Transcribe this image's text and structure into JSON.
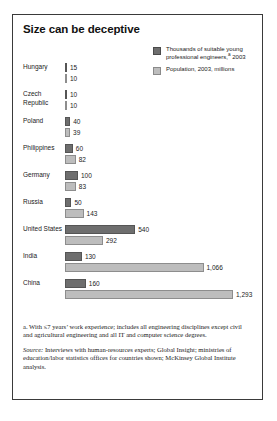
{
  "exhibit": {
    "title": "Size can be deceptive"
  },
  "legend": {
    "items": [
      {
        "label": "Thousands of suitable young professional engineers,",
        "sup": "a",
        "label_tail": " 2003",
        "swatch": "dark",
        "color": "#6e6e6e"
      },
      {
        "label": "Population, 2003, millions",
        "sup": "",
        "label_tail": "",
        "swatch": "light",
        "color": "#bdbdbd"
      }
    ]
  },
  "notes": {
    "footnote_marker": "a.",
    "footnote": "With ≤7 years’ work experience; includes all engineering disciplines except civil and agricultural engineering and all IT and computer science degrees.",
    "source_label": "Source:",
    "source": "Interviews with human-resources experts; Global Insight; ministries of education/labor statistics offices for countries shown; McKinsey Global Institute analysis."
  },
  "chart_data": {
    "type": "bar",
    "title": "Size can be deceptive",
    "xlabel": "",
    "ylabel": "",
    "orientation": "horizontal",
    "grid": false,
    "legend_position": "top-right",
    "xlim": [
      0,
      1293
    ],
    "categories": [
      "Hungary",
      "Czech Republic",
      "Poland",
      "Philippines",
      "Germany",
      "Russia",
      "United States",
      "India",
      "China"
    ],
    "series": [
      {
        "name": "Thousands of suitable young professional engineers,a 2003",
        "color": "#6e6e6e",
        "values": [
          15,
          10,
          40,
          60,
          100,
          50,
          540,
          130,
          160
        ],
        "labels": [
          "15",
          "10",
          "40",
          "60",
          "100",
          "50",
          "540",
          "130",
          "160"
        ]
      },
      {
        "name": "Population, 2003, millions",
        "color": "#bdbdbd",
        "values": [
          10,
          10,
          39,
          82,
          83,
          143,
          292,
          1066,
          1293
        ],
        "labels": [
          "10",
          "10",
          "39",
          "82",
          "83",
          "143",
          "292",
          "1,066",
          "1,293"
        ]
      }
    ]
  }
}
